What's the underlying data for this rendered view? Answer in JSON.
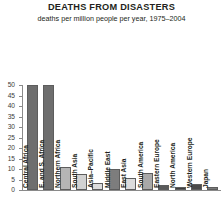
{
  "chart_data": {
    "type": "bar",
    "title": "DEATHS FROM DISASTERS",
    "subtitle": "deaths per million people per year, 1975–2004",
    "xlabel": "",
    "ylabel": "",
    "ylim": [
      0,
      50
    ],
    "yticks": [
      50,
      45,
      40,
      35,
      30,
      25,
      20,
      15,
      10,
      5,
      0
    ],
    "grid": false,
    "legend": "none",
    "categories": [
      "Central Africa",
      "E. and S. Africa",
      "Northern Africa",
      "South Asia",
      "Asia–Pacific",
      "Middle East",
      "East Asia",
      "South America",
      "Eastern Europe",
      "North America",
      "Western Europe",
      "Japan"
    ],
    "values": [
      50,
      50,
      11,
      7.5,
      3.5,
      10,
      5.5,
      8,
      2.5,
      1.5,
      3,
      1.5
    ],
    "bar_colors": [
      "#6e6e6e",
      "#6e6e6e",
      "#b5b5b5",
      "#d2d2d2",
      "#dcdcdc",
      "#7d7d7d",
      "#dcdcdc",
      "#a8a8a8",
      "#5a5a5a",
      "#3d3d3d",
      "#4a4a4a",
      "#7a7a7a"
    ]
  },
  "colors": {
    "axis": "#8a8a8a",
    "text": "#231f20",
    "background": "#ffffff"
  }
}
